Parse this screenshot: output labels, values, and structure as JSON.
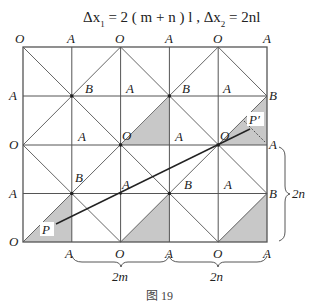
{
  "formula": {
    "part1": "Δx",
    "sub1": "1",
    "part2": " = 2 ( m + n ) l , Δx",
    "sub2": "2",
    "part3": " = 2nl"
  },
  "grid": {
    "left": 23,
    "top": 47,
    "cell": 48.8,
    "cols": 5,
    "rows": 4,
    "line_color": "#555555",
    "shade_color": "#c8c8c8"
  },
  "labels": {
    "top": [
      "O",
      "A",
      "O",
      "A",
      "O",
      "A"
    ],
    "bottom": [
      "O",
      "A",
      "O",
      "A",
      "O",
      "A"
    ],
    "left": [
      "O",
      "A",
      "O",
      "A",
      "O"
    ],
    "right_b1": "B",
    "right_a": "A",
    "right_b2": "B",
    "inner": [
      {
        "t": "B",
        "x": 78,
        "y": 92
      },
      {
        "t": "A",
        "x": 127,
        "y": 92
      },
      {
        "t": "B",
        "x": 175,
        "y": 92
      },
      {
        "t": "A",
        "x": 224,
        "y": 92
      },
      {
        "t": "A",
        "x": 78,
        "y": 141
      },
      {
        "t": "O",
        "x": 122,
        "y": 140
      },
      {
        "t": "A",
        "x": 175,
        "y": 141
      },
      {
        "t": "O",
        "x": 220,
        "y": 140
      },
      {
        "t": "B",
        "x": 76,
        "y": 185
      },
      {
        "t": "A",
        "x": 122,
        "y": 189
      },
      {
        "t": "B",
        "x": 175,
        "y": 189
      },
      {
        "t": "A",
        "x": 224,
        "y": 189
      }
    ],
    "P": "P",
    "P_prime": "P′"
  },
  "braces": {
    "bottom_left": "2m",
    "bottom_right": "2n",
    "right": "2n"
  },
  "caption": "图 19"
}
